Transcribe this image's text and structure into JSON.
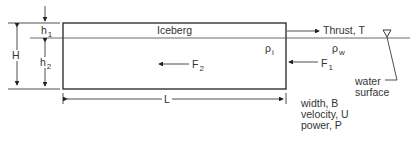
{
  "diagram": {
    "title_label": "Iceberg",
    "thrust_label": "Thrust, T",
    "rho_i": {
      "symbol": "ρ",
      "sub": "i"
    },
    "rho_w": {
      "symbol": "ρ",
      "sub": "w"
    },
    "f1": {
      "symbol": "F",
      "sub": "1"
    },
    "f2": {
      "symbol": "F",
      "sub": "2"
    },
    "h1": {
      "symbol": "h",
      "sub": "1"
    },
    "h2": {
      "symbol": "h",
      "sub": "2"
    },
    "H": "H",
    "L": "L",
    "water_surface": [
      "water",
      "surface"
    ],
    "notes": [
      "width, B",
      "velocity, U",
      "power, P"
    ]
  }
}
